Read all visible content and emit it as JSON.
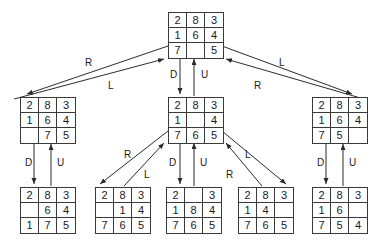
{
  "diagram": {
    "stroke_color": "#3a3a3a",
    "text_color": "#1a1a1a",
    "background_color": "#ffffff",
    "blank_label": ""
  },
  "nodes": [
    {
      "id": "root",
      "name": "root-state",
      "x": 168,
      "y": 12,
      "cells": [
        "2",
        "8",
        "3",
        "1",
        "6",
        "4",
        "7",
        "",
        "5"
      ]
    },
    {
      "id": "level1-left",
      "name": "level1-left-state",
      "x": 20,
      "y": 97,
      "cells": [
        "2",
        "8",
        "3",
        "1",
        "6",
        "4",
        "",
        "7",
        "5"
      ]
    },
    {
      "id": "level1-middle",
      "name": "level1-middle-state",
      "x": 168,
      "y": 97,
      "cells": [
        "2",
        "8",
        "3",
        "1",
        "",
        "4",
        "7",
        "6",
        "5"
      ]
    },
    {
      "id": "level1-right",
      "name": "level1-right-state",
      "x": 312,
      "y": 97,
      "cells": [
        "2",
        "8",
        "3",
        "1",
        "6",
        "4",
        "7",
        "5",
        ""
      ]
    },
    {
      "id": "level2-a",
      "name": "level2-state-a",
      "x": 20,
      "y": 187,
      "cells": [
        "2",
        "8",
        "3",
        "",
        "6",
        "4",
        "1",
        "7",
        "5"
      ]
    },
    {
      "id": "level2-b",
      "name": "level2-state-b",
      "x": 95,
      "y": 187,
      "cells": [
        "2",
        "8",
        "3",
        "",
        "1",
        "4",
        "7",
        "6",
        "5"
      ]
    },
    {
      "id": "level2-c",
      "name": "level2-state-c",
      "x": 166,
      "y": 187,
      "cells": [
        "2",
        "",
        "3",
        "1",
        "8",
        "4",
        "7",
        "6",
        "5"
      ]
    },
    {
      "id": "level2-d",
      "name": "level2-state-d",
      "x": 238,
      "y": 187,
      "cells": [
        "2",
        "8",
        "3",
        "1",
        "4",
        "",
        "7",
        "6",
        "5"
      ]
    },
    {
      "id": "level2-e",
      "name": "level2-state-e",
      "x": 312,
      "y": 187,
      "cells": [
        "2",
        "8",
        "3",
        "1",
        "6",
        "",
        "7",
        "5",
        "4"
      ]
    }
  ],
  "edge_labels": [
    {
      "id": "e1",
      "name": "edge-label-root-left-r",
      "text": "R",
      "x": 85,
      "y": 58
    },
    {
      "id": "e2",
      "name": "edge-label-root-left-l",
      "text": "L",
      "x": 108,
      "y": 81
    },
    {
      "id": "e3",
      "name": "edge-label-root-middle-d",
      "text": "D",
      "x": 170,
      "y": 70
    },
    {
      "id": "e4",
      "name": "edge-label-root-middle-u",
      "text": "U",
      "x": 201,
      "y": 70
    },
    {
      "id": "e5",
      "name": "edge-label-root-right-l",
      "text": "L",
      "x": 279,
      "y": 58
    },
    {
      "id": "e6",
      "name": "edge-label-root-right-r",
      "text": "R",
      "x": 254,
      "y": 81
    },
    {
      "id": "e7",
      "name": "edge-label-left-down-d",
      "text": "D",
      "x": 25,
      "y": 158
    },
    {
      "id": "e8",
      "name": "edge-label-left-down-u",
      "text": "U",
      "x": 57,
      "y": 158
    },
    {
      "id": "e9",
      "name": "edge-label-mid-left-r",
      "text": "R",
      "x": 124,
      "y": 150
    },
    {
      "id": "e10",
      "name": "edge-label-mid-left-l",
      "text": "L",
      "x": 144,
      "y": 170
    },
    {
      "id": "e11",
      "name": "edge-label-mid-down-d",
      "text": "D",
      "x": 169,
      "y": 158
    },
    {
      "id": "e12",
      "name": "edge-label-mid-down-u",
      "text": "U",
      "x": 200,
      "y": 158
    },
    {
      "id": "e13",
      "name": "edge-label-mid-right-l",
      "text": "L",
      "x": 245,
      "y": 150
    },
    {
      "id": "e14",
      "name": "edge-label-mid-right-r",
      "text": "R",
      "x": 226,
      "y": 170
    },
    {
      "id": "e15",
      "name": "edge-label-right-down-d",
      "text": "D",
      "x": 317,
      "y": 158
    },
    {
      "id": "e16",
      "name": "edge-label-right-down-u",
      "text": "U",
      "x": 349,
      "y": 158
    }
  ],
  "edges": [
    {
      "id": "a1",
      "name": "edge-root-to-left-outer",
      "x1": 168,
      "y1": 46,
      "x2": 27,
      "y2": 94,
      "arrow": "end"
    },
    {
      "id": "a2",
      "name": "edge-left-to-root-inner",
      "x1": 14,
      "y1": 99,
      "x2": 164,
      "y2": 59,
      "arrow": "end"
    },
    {
      "id": "a3",
      "name": "edge-root-to-middle-down",
      "x1": 180,
      "y1": 59,
      "x2": 180,
      "y2": 94,
      "arrow": "end"
    },
    {
      "id": "a4",
      "name": "edge-middle-to-root-up",
      "x1": 194,
      "y1": 96,
      "x2": 194,
      "y2": 59,
      "arrow": "end"
    },
    {
      "id": "a5",
      "name": "edge-root-to-right-outer",
      "x1": 222,
      "y1": 46,
      "x2": 352,
      "y2": 94,
      "arrow": "end"
    },
    {
      "id": "a6",
      "name": "edge-right-to-root-inner",
      "x1": 364,
      "y1": 99,
      "x2": 226,
      "y2": 59,
      "arrow": "end"
    },
    {
      "id": "a7",
      "name": "edge-left-down",
      "x1": 34,
      "y1": 144,
      "x2": 34,
      "y2": 184,
      "arrow": "end"
    },
    {
      "id": "a8",
      "name": "edge-left-up",
      "x1": 51,
      "y1": 186,
      "x2": 51,
      "y2": 144,
      "arrow": "end"
    },
    {
      "id": "a9",
      "name": "edge-middle-to-b-outer",
      "x1": 168,
      "y1": 131,
      "x2": 100,
      "y2": 184,
      "arrow": "end"
    },
    {
      "id": "a10",
      "name": "edge-b-to-middle-inner",
      "x1": 124,
      "y1": 186,
      "x2": 164,
      "y2": 143,
      "arrow": "end"
    },
    {
      "id": "a11",
      "name": "edge-middle-down",
      "x1": 180,
      "y1": 143,
      "x2": 180,
      "y2": 184,
      "arrow": "end"
    },
    {
      "id": "a12",
      "name": "edge-middle-up",
      "x1": 194,
      "y1": 186,
      "x2": 194,
      "y2": 143,
      "arrow": "end"
    },
    {
      "id": "a13",
      "name": "edge-middle-to-d-outer",
      "x1": 222,
      "y1": 131,
      "x2": 286,
      "y2": 184,
      "arrow": "end"
    },
    {
      "id": "a14",
      "name": "edge-d-to-middle-inner",
      "x1": 262,
      "y1": 186,
      "x2": 226,
      "y2": 143,
      "arrow": "end"
    },
    {
      "id": "a15",
      "name": "edge-right-down",
      "x1": 326,
      "y1": 144,
      "x2": 326,
      "y2": 184,
      "arrow": "end"
    },
    {
      "id": "a16",
      "name": "edge-right-up",
      "x1": 343,
      "y1": 186,
      "x2": 343,
      "y2": 144,
      "arrow": "end"
    }
  ]
}
